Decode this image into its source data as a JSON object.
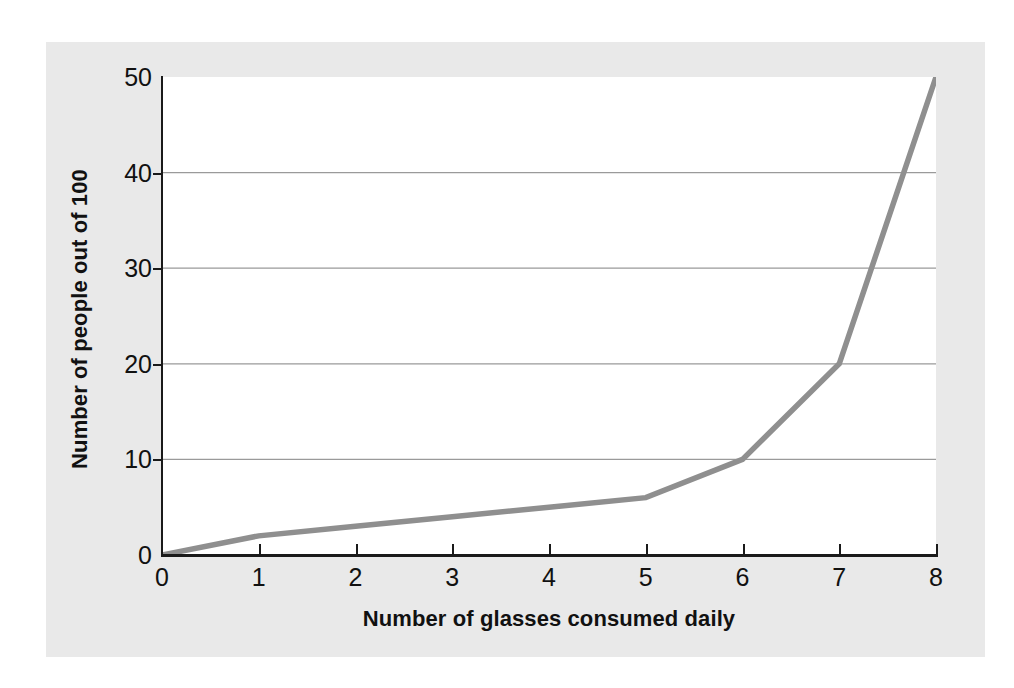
{
  "chart_data": {
    "type": "line",
    "title": "",
    "xlabel": "Number of glasses consumed daily",
    "ylabel": "Number of people out of 100",
    "x": [
      0,
      1,
      2,
      3,
      4,
      5,
      6,
      7,
      8
    ],
    "values": [
      0,
      2,
      3,
      4,
      5,
      6,
      10,
      20,
      50
    ],
    "series": [
      {
        "name": "Number of people out of 100",
        "values": [
          0,
          2,
          3,
          4,
          5,
          6,
          10,
          20,
          50
        ]
      }
    ],
    "xlim": [
      0,
      8
    ],
    "ylim": [
      0,
      50
    ],
    "xticks": [
      "0",
      "1",
      "2",
      "3",
      "4",
      "5",
      "6",
      "7",
      "8"
    ],
    "yticks": [
      "0",
      "10",
      "20",
      "30",
      "40",
      "50"
    ],
    "gridlines_y": [
      10,
      20,
      30,
      40
    ],
    "grid": true,
    "legend": "none",
    "line_color": "#8f8f8f",
    "grid_color": "#9a9a9a",
    "axis_color": "#1a1a1a",
    "panel_background": "#e9e9e9",
    "plot_background": "#ffffff"
  }
}
